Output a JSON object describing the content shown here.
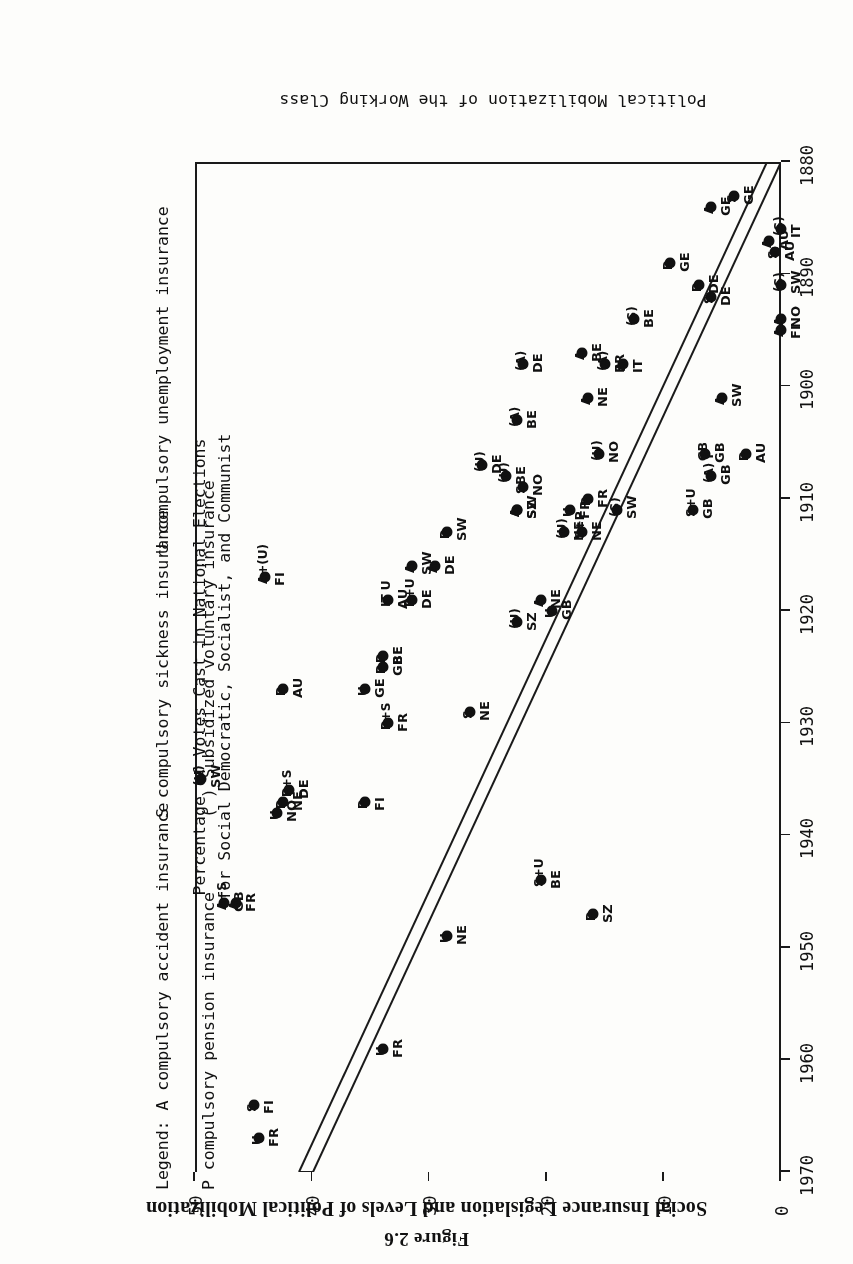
{
  "figure": {
    "number": "Figure 2.6",
    "title": "Social Insurance Legislation and Levels of Political Mobilization"
  },
  "axes": {
    "x_title": "Political Mobilization of the Working Class",
    "y_title_line1": "Percentage of Votes Cast in National Elections",
    "y_title_line2": "for Social Democratic, Socialist, and Communist",
    "x_ticks": [
      "1880",
      "1890",
      "1900",
      "1910",
      "1920",
      "1930",
      "1940",
      "1950",
      "1960",
      "1970"
    ],
    "y_ticks": [
      "0",
      "10",
      "20",
      "30",
      "40",
      "50"
    ],
    "xlim": [
      1880,
      1970
    ],
    "ylim": [
      0,
      50
    ]
  },
  "legend": {
    "prefix": "Legend:",
    "entries": [
      {
        "key": "A",
        "text": "compulsory accident insurance"
      },
      {
        "key": "S",
        "text": "compulsory sickness insurance"
      },
      {
        "key": "P",
        "text": "compulsory pension insurance"
      },
      {
        "key": "U",
        "text": "compulsory unemployment insurance"
      },
      {
        "key": "( )",
        "text": "Subsidized voluntary insurance"
      }
    ]
  },
  "chart_data": {
    "type": "scatter",
    "title": "Social Insurance Legislation and Levels of Political Mobilization",
    "xlabel": "Political Mobilization of the Working Class",
    "ylabel": "Percentage of Votes Cast in National Elections for Social Democratic, Socialist, and Communist",
    "xlim": [
      1880,
      1970
    ],
    "ylim": [
      0,
      50
    ],
    "grid": false,
    "legend_position": "below-right",
    "points": [
      {
        "country": "GE",
        "type": "A",
        "x": 1884,
        "y": 6.0
      },
      {
        "country": "GE",
        "type": "S",
        "x": 1883,
        "y": 4.0
      },
      {
        "country": "AU",
        "type": "A",
        "x": 1887,
        "y": 1.0
      },
      {
        "country": "AU",
        "type": "S",
        "x": 1888,
        "y": 0.5
      },
      {
        "country": "IT",
        "type": "(S)",
        "x": 1886,
        "y": 0.0
      },
      {
        "country": "GE",
        "type": "P",
        "x": 1889,
        "y": 9.5
      },
      {
        "country": "DE",
        "type": "P",
        "x": 1891,
        "y": 7.0
      },
      {
        "country": "DE",
        "type": "S",
        "x": 1892,
        "y": 6.0
      },
      {
        "country": "BE",
        "type": "(S)",
        "x": 1894,
        "y": 12.5
      },
      {
        "country": "SW",
        "type": "(S)",
        "x": 1891,
        "y": 0.0
      },
      {
        "country": "NO",
        "type": "A",
        "x": 1894,
        "y": 0.0
      },
      {
        "country": "FI",
        "type": "A",
        "x": 1895,
        "y": 0.0
      },
      {
        "country": "DE",
        "type": "(A)",
        "x": 1898,
        "y": 22.0
      },
      {
        "country": "BE",
        "type": "(A)",
        "x": 1903,
        "y": 22.5
      },
      {
        "country": "BE",
        "type": "A",
        "x": 1897,
        "y": 17.0
      },
      {
        "country": "FR",
        "type": "(A)",
        "x": 1898,
        "y": 15.0
      },
      {
        "country": "IT",
        "type": "A",
        "x": 1898,
        "y": 13.5
      },
      {
        "country": "NE",
        "type": "A",
        "x": 1901,
        "y": 16.5
      },
      {
        "country": "SW",
        "type": "A",
        "x": 1901,
        "y": 5.0
      },
      {
        "country": "GB",
        "type": "GB",
        "x": 1906,
        "y": 6.5
      },
      {
        "country": "GB",
        "type": "(A) P",
        "x": 1908,
        "y": 6.0
      },
      {
        "country": "GB",
        "type": "S+U",
        "x": 1911,
        "y": 7.5
      },
      {
        "country": "AU",
        "type": "P",
        "x": 1906,
        "y": 3.0
      },
      {
        "country": "DE",
        "type": "(U)",
        "x": 1907,
        "y": 25.5
      },
      {
        "country": "BE",
        "type": "(U)",
        "x": 1908,
        "y": 23.5
      },
      {
        "country": "NO",
        "type": "S",
        "x": 1909,
        "y": 22.0
      },
      {
        "country": "SZ",
        "type": "A",
        "x": 1911,
        "y": 22.5
      },
      {
        "country": "SW",
        "type": "A",
        "x": 1911,
        "y": 22.5
      },
      {
        "country": "NO",
        "type": "(U)",
        "x": 1906,
        "y": 15.5
      },
      {
        "country": "FR",
        "type": "U",
        "x": 1911,
        "y": 18.0
      },
      {
        "country": "NE",
        "type": "(U)",
        "x": 1913,
        "y": 18.5
      },
      {
        "country": "FR",
        "type": "P",
        "x": 1910,
        "y": 16.5
      },
      {
        "country": "NE",
        "type": "S+P",
        "x": 1913,
        "y": 17.0
      },
      {
        "country": "SW",
        "type": "(S)",
        "x": 1911,
        "y": 14.0
      },
      {
        "country": "SW",
        "type": "P",
        "x": 1913,
        "y": 28.5
      },
      {
        "country": "DE",
        "type": "A",
        "x": 1916,
        "y": 29.5
      },
      {
        "country": "SW",
        "type": "A",
        "x": 1916,
        "y": 31.5
      },
      {
        "country": "AU",
        "type": "IT U",
        "x": 1919,
        "y": 33.5
      },
      {
        "country": "DE",
        "type": "P+U",
        "x": 1919,
        "y": 31.5
      },
      {
        "country": "FI",
        "type": "A+(U)",
        "x": 1917,
        "y": 44.0
      },
      {
        "country": "NE",
        "type": "A",
        "x": 1919,
        "y": 20.5
      },
      {
        "country": "SZ",
        "type": "(U)",
        "x": 1921,
        "y": 22.5
      },
      {
        "country": "GB",
        "type": "U",
        "x": 1920,
        "y": 19.5
      },
      {
        "country": "GE",
        "type": "U",
        "x": 1927,
        "y": 35.5
      },
      {
        "country": "BE",
        "type": "P",
        "x": 1924,
        "y": 34.0
      },
      {
        "country": "GB",
        "type": "P",
        "x": 1925,
        "y": 34.0
      },
      {
        "country": "AU",
        "type": "P",
        "x": 1927,
        "y": 42.5
      },
      {
        "country": "NE",
        "type": "S",
        "x": 1929,
        "y": 26.5
      },
      {
        "country": "FR",
        "type": "P+S",
        "x": 1930,
        "y": 33.5
      },
      {
        "country": "DE",
        "type": "P+S",
        "x": 1936,
        "y": 42.0
      },
      {
        "country": "NE",
        "type": "P",
        "x": 1937,
        "y": 42.5
      },
      {
        "country": "NO",
        "type": "U",
        "x": 1938,
        "y": 43.0
      },
      {
        "country": "SW",
        "type": "(U)",
        "x": 1935,
        "y": 49.5
      },
      {
        "country": "FI",
        "type": "P",
        "x": 1937,
        "y": 35.5
      },
      {
        "country": "BE",
        "type": "S+U",
        "x": 1944,
        "y": 20.5
      },
      {
        "country": "NE",
        "type": "U",
        "x": 1949,
        "y": 28.5
      },
      {
        "country": "SZ",
        "type": "P",
        "x": 1947,
        "y": 16.0
      },
      {
        "country": "GB",
        "type": "A+S",
        "x": 1946,
        "y": 47.5
      },
      {
        "country": "FR",
        "type": "A",
        "x": 1946,
        "y": 46.5
      },
      {
        "country": "FR",
        "type": "U",
        "x": 1959,
        "y": 34.0
      },
      {
        "country": "FI",
        "type": "S",
        "x": 1964,
        "y": 45.0
      },
      {
        "country": "FR",
        "type": "U",
        "x": 1967,
        "y": 44.5
      }
    ],
    "trend_band": {
      "description": "Double-ruled diagonal envelope rising from lower-left to upper-left of the rotated plot",
      "p1": [
        1880,
        0
      ],
      "p2": [
        1952,
        50
      ]
    }
  }
}
